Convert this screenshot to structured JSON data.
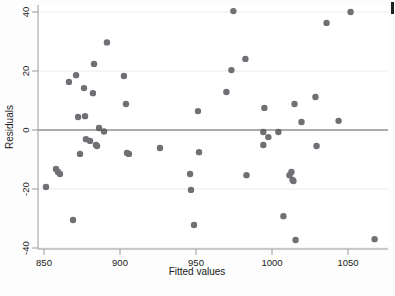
{
  "figure": {
    "background_color": "#fdfdfd",
    "plot_background_color": "#ffffff",
    "marker_color": "#6f6f74",
    "axis_color": "#9a9a9a",
    "zero_line_color": "#5a5a5a",
    "grid_color": "#ececec"
  },
  "chart_data": {
    "type": "scatter",
    "title": "",
    "subtitle": "",
    "xlabel": "Fitted values",
    "ylabel": "Residuals",
    "xlim": [
      846,
      1072
    ],
    "ylim": [
      -42,
      42
    ],
    "xticks": [
      850,
      900,
      950,
      1000,
      1050
    ],
    "xticklabels": [
      "850",
      "900",
      "950",
      "1000",
      "1050"
    ],
    "yticks": [
      -40,
      -20,
      0,
      20,
      40
    ],
    "yticklabels": [
      "-40",
      "-20",
      "0",
      "20",
      "40"
    ],
    "grid": "horizontal-faint",
    "legend": "none",
    "reference_lines": [
      {
        "name": "zero-residual-line",
        "orientation": "horizontal",
        "y": 0
      }
    ],
    "marker": {
      "shape": "circle",
      "size": 3.2,
      "color": "#6f6f74"
    },
    "points": [
      {
        "x": 851.3,
        "y": -19.3
      },
      {
        "x": 857.9,
        "y": -13.2
      },
      {
        "x": 859.2,
        "y": -14.2
      },
      {
        "x": 860.5,
        "y": -14.9
      },
      {
        "x": 866.4,
        "y": 16.3
      },
      {
        "x": 869.1,
        "y": -30.5
      },
      {
        "x": 871.1,
        "y": 18.6
      },
      {
        "x": 872.4,
        "y": 4.4
      },
      {
        "x": 873.7,
        "y": -8.1
      },
      {
        "x": 876.3,
        "y": 14.2
      },
      {
        "x": 877.0,
        "y": 4.7
      },
      {
        "x": 877.6,
        "y": -3.1
      },
      {
        "x": 880.3,
        "y": -3.7
      },
      {
        "x": 882.2,
        "y": 12.5
      },
      {
        "x": 882.9,
        "y": 22.4
      },
      {
        "x": 884.2,
        "y": -5.1
      },
      {
        "x": 884.9,
        "y": -5.4
      },
      {
        "x": 886.2,
        "y": 0.7
      },
      {
        "x": 889.5,
        "y": -0.5
      },
      {
        "x": 891.4,
        "y": 29.7
      },
      {
        "x": 902.6,
        "y": 18.3
      },
      {
        "x": 903.9,
        "y": 8.8
      },
      {
        "x": 904.6,
        "y": -7.8
      },
      {
        "x": 905.9,
        "y": -8.1
      },
      {
        "x": 926.3,
        "y": -6.1
      },
      {
        "x": 946.1,
        "y": -14.9
      },
      {
        "x": 946.7,
        "y": -20.3
      },
      {
        "x": 948.7,
        "y": -32.2
      },
      {
        "x": 951.3,
        "y": 6.4
      },
      {
        "x": 952.0,
        "y": -7.5
      },
      {
        "x": 970.0,
        "y": 12.9
      },
      {
        "x": 973.3,
        "y": 20.3
      },
      {
        "x": 974.6,
        "y": 40.3
      },
      {
        "x": 982.5,
        "y": 24.1
      },
      {
        "x": 983.2,
        "y": -15.3
      },
      {
        "x": 994.3,
        "y": -0.7
      },
      {
        "x": 994.3,
        "y": -5.1
      },
      {
        "x": 995.0,
        "y": 7.5
      },
      {
        "x": 997.6,
        "y": -2.4
      },
      {
        "x": 1004.2,
        "y": -0.7
      },
      {
        "x": 1007.5,
        "y": -29.2
      },
      {
        "x": 1011.5,
        "y": -15.3
      },
      {
        "x": 1012.8,
        "y": -14.2
      },
      {
        "x": 1013.5,
        "y": -16.9
      },
      {
        "x": 1014.1,
        "y": -17.3
      },
      {
        "x": 1014.8,
        "y": 8.8
      },
      {
        "x": 1015.5,
        "y": -37.3
      },
      {
        "x": 1019.4,
        "y": 2.7
      },
      {
        "x": 1028.6,
        "y": 11.2
      },
      {
        "x": 1029.3,
        "y": -5.4
      },
      {
        "x": 1035.9,
        "y": 36.3
      },
      {
        "x": 1043.8,
        "y": 3.1
      },
      {
        "x": 1051.7,
        "y": 40.0
      },
      {
        "x": 1067.5,
        "y": -37.0
      }
    ]
  }
}
